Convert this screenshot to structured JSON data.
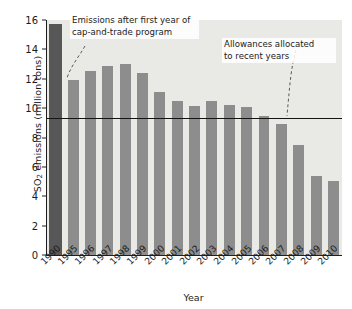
{
  "chart_data": {
    "type": "bar",
    "title": "",
    "xlabel": "Year",
    "ylabel": "SO2 emissions (million tons)",
    "ylabel_html": "SO<sub>2</sub> emissions (million tons)",
    "categories": [
      "1990",
      "1995",
      "1996",
      "1997",
      "1998",
      "1999",
      "2000",
      "2001",
      "2002",
      "2003",
      "2004",
      "2005",
      "2006",
      "2007",
      "2008",
      "2009",
      "2010"
    ],
    "values": [
      15.7,
      11.9,
      12.5,
      12.9,
      13.0,
      12.4,
      11.1,
      10.5,
      10.15,
      10.5,
      10.2,
      10.1,
      9.45,
      8.9,
      7.5,
      5.35,
      5.05
    ],
    "ylim": [
      0,
      16
    ],
    "yticks": [
      0,
      2,
      4,
      6,
      8,
      10,
      12,
      14,
      16
    ],
    "ytick_labels": [
      "0",
      "2",
      "4",
      "6",
      "8",
      "10",
      "12",
      "14",
      "16"
    ],
    "grid": false,
    "legend": "none",
    "highlight_index": 0,
    "colors": {
      "bar": "#8d8d8d",
      "highlight_bar": "#575757",
      "plot_background": "#e9e9e6",
      "axis": "#1f1f1f",
      "reference_line": "#141414",
      "text": "#1b1b1b"
    },
    "reference_lines": [
      {
        "name": "allowances",
        "value": 9.3,
        "label": "Allowances allocated to recent years"
      }
    ],
    "annotations": [
      {
        "name": "cap-and-trade-note",
        "text": "Emissions after first year of\ncap-and-trade program",
        "points_to": "1995"
      },
      {
        "name": "allowances-note",
        "text": "Allowances allocated\nto recent years",
        "points_to": "allowance-line"
      }
    ]
  }
}
